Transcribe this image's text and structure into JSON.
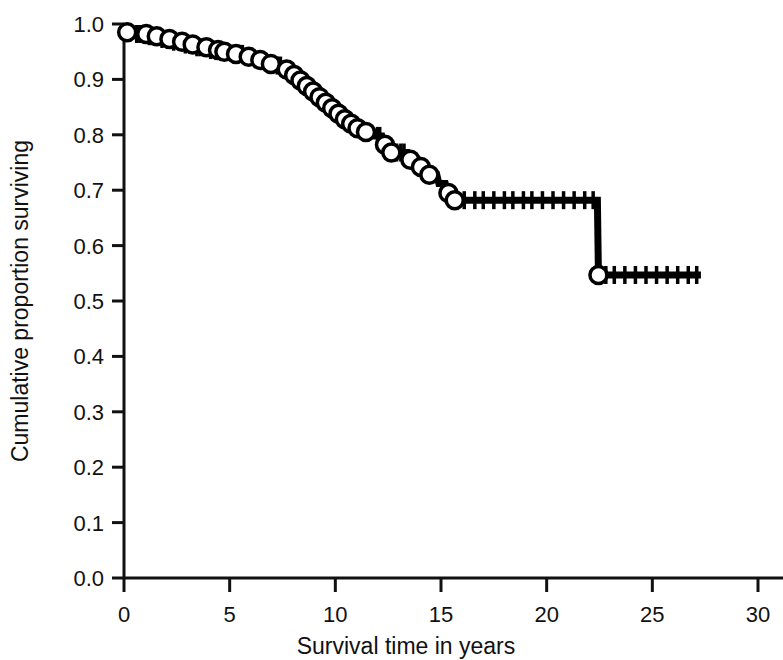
{
  "chart_data": {
    "type": "line",
    "subtype": "kaplan-meier-survival-step",
    "title": "",
    "xlabel": "Survival time in years",
    "ylabel": "Cumulative proportion surviving",
    "xlim": [
      0,
      30
    ],
    "ylim": [
      0.0,
      1.0
    ],
    "xticks": [
      0,
      5,
      10,
      15,
      20,
      25,
      30
    ],
    "xtick_labels": [
      "0",
      "5",
      "10",
      "15",
      "20",
      "25",
      "30"
    ],
    "yticks": [
      0.0,
      0.1,
      0.2,
      0.3,
      0.4,
      0.5,
      0.6,
      0.7,
      0.8,
      0.9,
      1.0
    ],
    "ytick_labels": [
      "0.0",
      "0.1",
      "0.2",
      "0.3",
      "0.4",
      "0.5",
      "0.6",
      "0.7",
      "0.8",
      "0.9",
      "1.0"
    ],
    "grid": false,
    "legend": null,
    "line_color": "#000000",
    "marker_style": "open-circle",
    "marker_label": "censored observation",
    "tick_mark_label": "censoring tick",
    "series": [
      {
        "name": "Cumulative survival",
        "step_points": [
          [
            0.0,
            0.985
          ],
          [
            0.4,
            0.985
          ],
          [
            0.5,
            0.982
          ],
          [
            0.9,
            0.982
          ],
          [
            1.0,
            0.978
          ],
          [
            1.4,
            0.978
          ],
          [
            1.5,
            0.973
          ],
          [
            2.0,
            0.973
          ],
          [
            2.1,
            0.968
          ],
          [
            2.6,
            0.968
          ],
          [
            2.7,
            0.963
          ],
          [
            3.1,
            0.963
          ],
          [
            3.2,
            0.958
          ],
          [
            3.7,
            0.958
          ],
          [
            3.8,
            0.953
          ],
          [
            4.3,
            0.953
          ],
          [
            4.4,
            0.95
          ],
          [
            5.0,
            0.95
          ],
          [
            5.1,
            0.946
          ],
          [
            5.6,
            0.946
          ],
          [
            5.7,
            0.941
          ],
          [
            6.2,
            0.941
          ],
          [
            6.3,
            0.935
          ],
          [
            6.6,
            0.935
          ],
          [
            6.7,
            0.928
          ],
          [
            7.0,
            0.928
          ],
          [
            7.1,
            0.925
          ],
          [
            7.6,
            0.925
          ],
          [
            7.7,
            0.918
          ],
          [
            7.9,
            0.918
          ],
          [
            8.0,
            0.908
          ],
          [
            8.2,
            0.908
          ],
          [
            8.3,
            0.898
          ],
          [
            8.5,
            0.898
          ],
          [
            8.6,
            0.888
          ],
          [
            8.8,
            0.888
          ],
          [
            8.9,
            0.878
          ],
          [
            9.1,
            0.878
          ],
          [
            9.2,
            0.868
          ],
          [
            9.4,
            0.868
          ],
          [
            9.5,
            0.858
          ],
          [
            9.7,
            0.858
          ],
          [
            9.8,
            0.848
          ],
          [
            10.0,
            0.848
          ],
          [
            10.1,
            0.838
          ],
          [
            10.3,
            0.838
          ],
          [
            10.4,
            0.828
          ],
          [
            10.6,
            0.828
          ],
          [
            10.7,
            0.82
          ],
          [
            10.9,
            0.82
          ],
          [
            11.0,
            0.812
          ],
          [
            11.3,
            0.812
          ],
          [
            11.4,
            0.805
          ],
          [
            11.8,
            0.805
          ],
          [
            11.9,
            0.798
          ],
          [
            12.2,
            0.798
          ],
          [
            12.3,
            0.782
          ],
          [
            12.5,
            0.782
          ],
          [
            12.6,
            0.768
          ],
          [
            13.4,
            0.768
          ],
          [
            13.5,
            0.755
          ],
          [
            13.9,
            0.755
          ],
          [
            14.0,
            0.742
          ],
          [
            14.3,
            0.742
          ],
          [
            14.4,
            0.728
          ],
          [
            14.8,
            0.728
          ],
          [
            14.9,
            0.712
          ],
          [
            15.2,
            0.712
          ],
          [
            15.3,
            0.695
          ],
          [
            15.5,
            0.695
          ],
          [
            15.6,
            0.682
          ],
          [
            22.4,
            0.682
          ],
          [
            22.45,
            0.547
          ],
          [
            27.3,
            0.547
          ]
        ],
        "censor_markers": [
          [
            0.15,
            0.985
          ],
          [
            1.05,
            0.982
          ],
          [
            1.55,
            0.978
          ],
          [
            2.15,
            0.973
          ],
          [
            2.75,
            0.968
          ],
          [
            3.25,
            0.963
          ],
          [
            3.9,
            0.958
          ],
          [
            4.45,
            0.953
          ],
          [
            4.75,
            0.95
          ],
          [
            5.3,
            0.946
          ],
          [
            5.9,
            0.941
          ],
          [
            6.45,
            0.935
          ],
          [
            6.95,
            0.928
          ],
          [
            7.7,
            0.918
          ],
          [
            8.05,
            0.908
          ],
          [
            8.35,
            0.898
          ],
          [
            8.65,
            0.888
          ],
          [
            8.95,
            0.878
          ],
          [
            9.25,
            0.868
          ],
          [
            9.55,
            0.858
          ],
          [
            9.85,
            0.848
          ],
          [
            10.15,
            0.838
          ],
          [
            10.45,
            0.828
          ],
          [
            10.75,
            0.82
          ],
          [
            11.05,
            0.812
          ],
          [
            11.45,
            0.805
          ],
          [
            12.35,
            0.782
          ],
          [
            12.65,
            0.768
          ],
          [
            13.55,
            0.755
          ],
          [
            14.05,
            0.742
          ],
          [
            14.45,
            0.728
          ],
          [
            15.35,
            0.695
          ],
          [
            15.65,
            0.682
          ],
          [
            22.45,
            0.547
          ]
        ],
        "censor_ticks_on_plateau_068": [
          16.1,
          16.6,
          17.0,
          17.5,
          18.0,
          18.4,
          18.9,
          19.3,
          19.8,
          20.3,
          20.8,
          21.3,
          21.8,
          22.2
        ],
        "censor_ticks_on_plateau_055": [
          22.8,
          23.2,
          23.7,
          24.2,
          24.7,
          25.2,
          25.7,
          26.2,
          26.7,
          27.1
        ],
        "censor_ticks_early": [
          0.3,
          0.6,
          0.75,
          1.2,
          1.35,
          1.8,
          2.35,
          2.9,
          3.45,
          3.6,
          4.1,
          4.6,
          5.45,
          5.6,
          6.05,
          6.8,
          7.25,
          7.4,
          12.0,
          12.1,
          12.9,
          13.1,
          13.25
        ]
      }
    ],
    "key_values": {
      "survival_at_0": 0.985,
      "plateau_value_16_to_22": 0.682,
      "final_value": 0.547,
      "drop_time_years": 22.4,
      "last_observation_years": 27.3
    }
  }
}
